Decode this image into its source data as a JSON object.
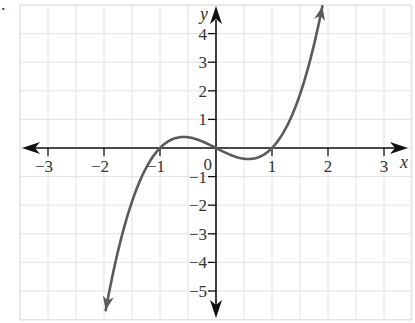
{
  "figure": {
    "marker": "."
  },
  "chart_data": {
    "type": "line",
    "title": "",
    "function": "y = x^3 - x",
    "xlabel": "x",
    "ylabel": "y",
    "xlim": [
      -3.5,
      3.5
    ],
    "ylim": [
      -5.5,
      4.6
    ],
    "grid": true,
    "grid_x_step": 0.5,
    "grid_y_step": 1,
    "x_ticks": [
      -3,
      -2,
      -1,
      1,
      2,
      3
    ],
    "x_tick_labels": [
      "−3",
      "−2",
      "−1",
      "1",
      "2",
      "3"
    ],
    "y_ticks": [
      4,
      3,
      2,
      1,
      -1,
      -2,
      -3,
      -4,
      -5
    ],
    "y_tick_labels": [
      "4",
      "3",
      "2",
      "1",
      "−1",
      "−2",
      "−3",
      "−4",
      "−5"
    ],
    "origin_label": "0",
    "x_roots": [
      -1,
      0,
      1
    ],
    "local_max": {
      "x": -0.577,
      "y": 0.385
    },
    "local_min": {
      "x": 0.577,
      "y": -0.385
    },
    "x": [
      -1.97,
      -1.75,
      -1.5,
      -1.25,
      -1.0,
      -0.75,
      -0.577,
      -0.5,
      -0.25,
      0,
      0.25,
      0.5,
      0.577,
      0.75,
      1.0,
      1.25,
      1.5,
      1.75,
      1.9
    ],
    "y": [
      -5.68,
      -3.61,
      -1.875,
      -0.703,
      0,
      0.328,
      0.385,
      0.375,
      0.234,
      0,
      -0.234,
      -0.375,
      -0.385,
      -0.328,
      0,
      0.703,
      1.875,
      3.61,
      4.96
    ],
    "curve_color": "#5a5a5a",
    "axis_color": "#111111",
    "grid_color": "#e2e2e2"
  }
}
